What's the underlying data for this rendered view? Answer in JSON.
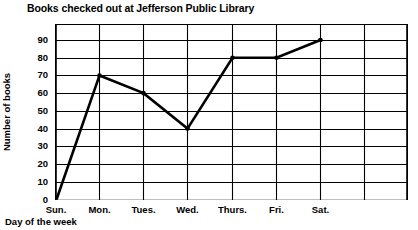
{
  "chart_data": {
    "type": "line",
    "title": "Books checked out at Jefferson Public Library",
    "xlabel": "Day of the week",
    "ylabel": "Number of books",
    "categories": [
      "Sun.",
      "Mon.",
      "Tues.",
      "Wed.",
      "Thurs.",
      "Fri.",
      "Sat."
    ],
    "values": [
      0,
      70,
      60,
      40,
      80,
      80,
      90
    ],
    "series": [
      {
        "name": "Books checked out",
        "values": [
          0,
          70,
          60,
          40,
          80,
          80,
          90
        ]
      }
    ],
    "ylim": [
      0,
      90
    ],
    "yticks": [
      0,
      10,
      20,
      30,
      40,
      50,
      60,
      70,
      80,
      90
    ],
    "ytick_labels": [
      "0",
      "10",
      "20",
      "30",
      "40",
      "50",
      "60",
      "70",
      "80",
      "90"
    ],
    "xtick_labels": [
      "Sun.",
      "Mon.",
      "Tues.",
      "Wed.",
      "Thurs.",
      "Fri.",
      "Sat."
    ],
    "grid": true,
    "grid_axes": "both",
    "legend": false,
    "legend_position": "none",
    "line_color": "#000000",
    "grid_color": "#000000",
    "marker": "circle",
    "marker_color": "#000000",
    "background_color": "#ffffff"
  }
}
